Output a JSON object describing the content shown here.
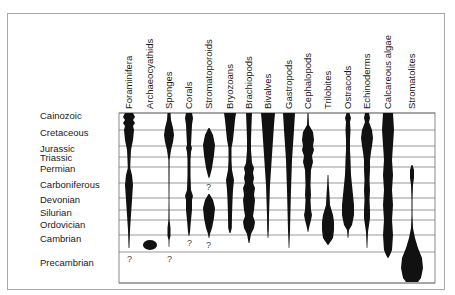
{
  "diagram": {
    "periods": [
      {
        "label": "Cainozoic",
        "y": 116
      },
      {
        "label": "Cretaceous",
        "y": 133
      },
      {
        "label": "Jurassic",
        "y": 149
      },
      {
        "label": "Triassic",
        "y": 158
      },
      {
        "label": "Permian",
        "y": 169
      },
      {
        "label": "Carboniferous",
        "y": 185
      },
      {
        "label": "Devonian",
        "y": 200
      },
      {
        "label": "Silurian",
        "y": 213
      },
      {
        "label": "Ordovician",
        "y": 225
      },
      {
        "label": "Cambrian",
        "y": 239
      },
      {
        "label": "Precambrian",
        "y": 263
      }
    ],
    "grid_lines_y": [
      113,
      130,
      146,
      157,
      167,
      183,
      198,
      210,
      220,
      235,
      252,
      283
    ],
    "chart_box": {
      "x": 119,
      "y": 113,
      "width": 316,
      "height": 170
    },
    "groups": [
      {
        "label": "Foraminifera",
        "x": 129
      },
      {
        "label": "Archaeocyathids",
        "x": 150
      },
      {
        "label": "Sponges",
        "x": 169
      },
      {
        "label": "Corals",
        "x": 189
      },
      {
        "label": "Stromatoporoids",
        "x": 209
      },
      {
        "label": "Bryozoans",
        "x": 230
      },
      {
        "label": "Brachiopods",
        "x": 249
      },
      {
        "label": "Bivalves",
        "x": 268
      },
      {
        "label": "Gastropods",
        "x": 289
      },
      {
        "label": "Cephalopods",
        "x": 308
      },
      {
        "label": "Trilobites",
        "x": 328
      },
      {
        "label": "Ostracods",
        "x": 348
      },
      {
        "label": "Echinoderms",
        "x": 367
      },
      {
        "label": "Calcareous algae",
        "x": 388
      },
      {
        "label": "Stromatolites",
        "x": 412
      }
    ],
    "uncertain_marks": [
      {
        "text": "?",
        "x": 127,
        "y": 254
      },
      {
        "text": "?",
        "x": 167,
        "y": 254
      },
      {
        "text": "?",
        "x": 187,
        "y": 238
      },
      {
        "text": "?",
        "x": 206,
        "y": 240
      },
      {
        "text": "?",
        "x": 206,
        "y": 182
      }
    ],
    "colors": {
      "fill": "#111111",
      "grid": "#6e6e6e",
      "frame": "#a8a8a8"
    }
  }
}
